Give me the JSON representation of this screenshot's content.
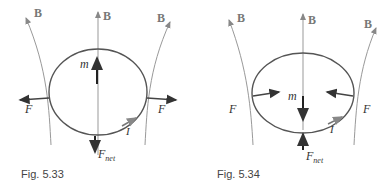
{
  "figures": [
    {
      "id": "fig-5-33",
      "caption": "Fig. 5.33",
      "field_label": "B",
      "moment_label": "m",
      "force_label": "F",
      "net_force_label": "F",
      "net_force_subscript": "net",
      "current_label": "I",
      "moment_direction": "up",
      "force_direction": "outward",
      "net_force_direction": "down"
    },
    {
      "id": "fig-5-34",
      "caption": "Fig. 5.34",
      "field_label": "B",
      "moment_label": "m",
      "force_label": "F",
      "net_force_label": "F",
      "net_force_subscript": "net",
      "current_label": "I",
      "moment_direction": "down",
      "force_direction": "inward",
      "net_force_direction": "up"
    }
  ],
  "colors": {
    "field_lines": "#888888",
    "loop": "#555555",
    "vectors": "#222222"
  }
}
